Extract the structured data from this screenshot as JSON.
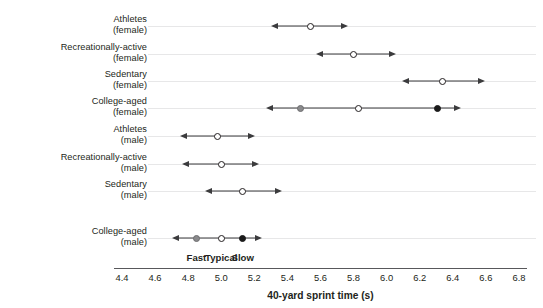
{
  "chart_data": {
    "type": "scatter",
    "title": "",
    "xlabel": "40-yard sprint time (s)",
    "ylabel": "",
    "xlim": [
      4.4,
      6.8
    ],
    "xticks": [
      "4.4",
      "4.6",
      "4.8",
      "5.0",
      "5.2",
      "5.4",
      "5.6",
      "5.8",
      "6.0",
      "6.2",
      "6.4",
      "6.6",
      "6.8"
    ],
    "xtick_values": [
      4.4,
      4.6,
      4.8,
      5.0,
      5.2,
      5.4,
      5.6,
      5.8,
      6.0,
      6.2,
      6.4,
      6.6,
      6.8
    ],
    "grid": false,
    "legend_position": "inline-bottom-row",
    "legend": [
      {
        "key": "fast",
        "label": "Fast",
        "marker": "gray",
        "at": 4.85
      },
      {
        "key": "typical",
        "label": "Typical",
        "marker": "open",
        "at": 5.0
      },
      {
        "key": "slow",
        "label": "Slow",
        "marker": "black",
        "at": 5.13
      }
    ],
    "categories": [
      {
        "line1": "Athletes",
        "line2": "(female)"
      },
      {
        "line1": "Recreationally-active",
        "line2": "(female)"
      },
      {
        "line1": "Sedentary",
        "line2": "(female)"
      },
      {
        "line1": "College-aged",
        "line2": "(female)"
      },
      {
        "line1": "Athletes",
        "line2": "(male)"
      },
      {
        "line1": "Recreationally-active",
        "line2": "(male)"
      },
      {
        "line1": "Sedentary",
        "line2": "(male)"
      },
      {
        "line1": "College-aged",
        "line2": "(male)"
      }
    ],
    "rows": [
      {
        "category": "Athletes (female)",
        "typical": 5.54,
        "low": 5.3,
        "high": 5.77,
        "markers": [
          {
            "type": "open",
            "value": 5.54
          }
        ]
      },
      {
        "category": "Recreationally-active (female)",
        "typical": 5.8,
        "low": 5.57,
        "high": 6.06,
        "markers": [
          {
            "type": "open",
            "value": 5.8
          }
        ]
      },
      {
        "category": "Sedentary (female)",
        "typical": 6.34,
        "low": 6.09,
        "high": 6.6,
        "markers": [
          {
            "type": "open",
            "value": 6.34
          }
        ]
      },
      {
        "category": "College-aged (female)",
        "typical": 5.83,
        "low": 5.27,
        "high": 6.45,
        "markers": [
          {
            "type": "gray",
            "value": 5.48
          },
          {
            "type": "open",
            "value": 5.83
          },
          {
            "type": "black",
            "value": 6.31
          }
        ]
      },
      {
        "category": "Athletes (male)",
        "typical": 4.98,
        "low": 4.75,
        "high": 5.21,
        "markers": [
          {
            "type": "open",
            "value": 4.98
          }
        ]
      },
      {
        "category": "Recreationally-active (male)",
        "typical": 5.0,
        "low": 4.76,
        "high": 5.23,
        "markers": [
          {
            "type": "open",
            "value": 5.0
          }
        ]
      },
      {
        "category": "Sedentary (male)",
        "typical": 5.13,
        "low": 4.9,
        "high": 5.37,
        "markers": [
          {
            "type": "open",
            "value": 5.13
          }
        ]
      },
      {
        "category": "College-aged (male)",
        "typical": 5.0,
        "low": 4.7,
        "high": 5.25,
        "markers": [
          {
            "type": "gray",
            "value": 4.85
          },
          {
            "type": "open",
            "value": 5.0
          },
          {
            "type": "black",
            "value": 5.13
          }
        ]
      }
    ]
  },
  "geometry": {
    "x_at_4_4": 122,
    "px_per_second": 165.4,
    "row_y": [
      26,
      54,
      81,
      108,
      136,
      164,
      191,
      238
    ],
    "legend_y": 252,
    "axis_y": 268,
    "tick_label_y": 272,
    "axis_title_y": 290
  }
}
